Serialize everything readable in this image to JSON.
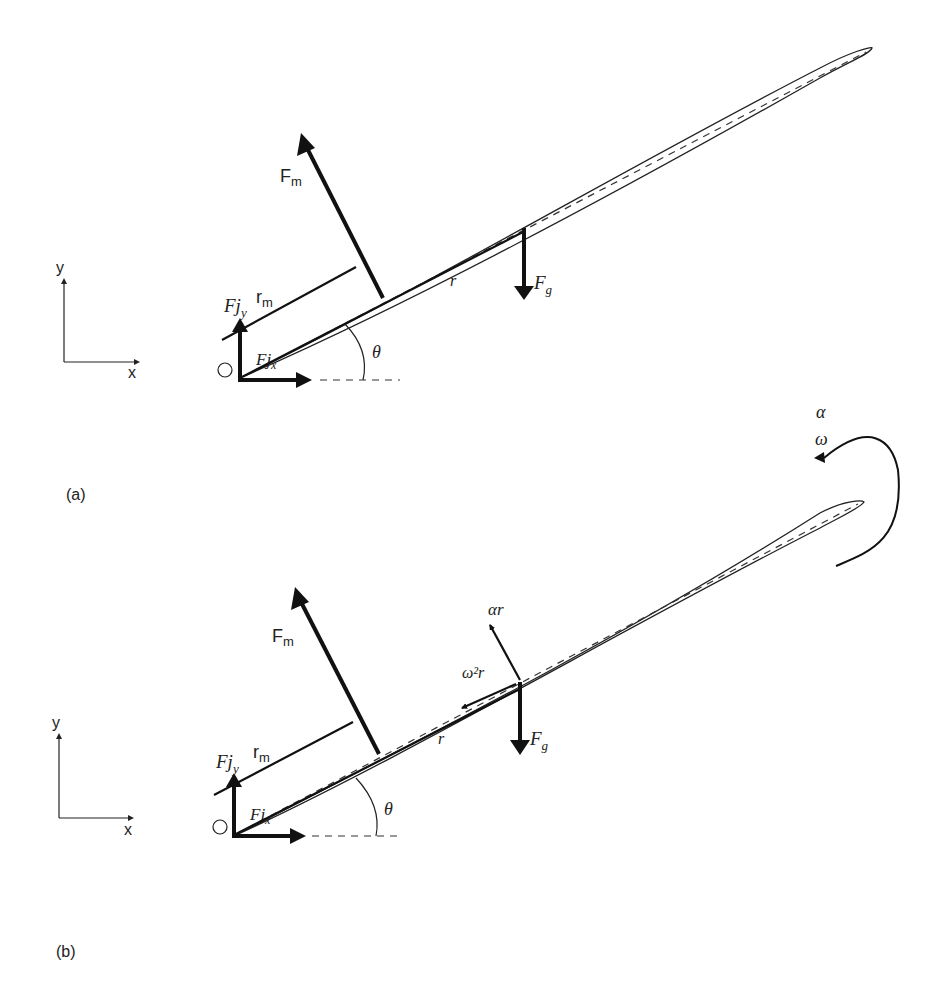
{
  "panels": [
    {
      "id": "a",
      "caption": "(a)",
      "axes": {
        "y": "y",
        "x": "x"
      },
      "origin": "O",
      "labels": {
        "Fm": "F",
        "Fm_sub": "m",
        "Fjy": "Fj",
        "Fjy_sub": "y",
        "Fjx": "Fj",
        "Fjx_sub": "x",
        "rm": "r",
        "rm_sub": "m",
        "r": "r",
        "Fg": "F",
        "Fg_sub": "g",
        "theta": "θ"
      }
    },
    {
      "id": "b",
      "caption": "(b)",
      "axes": {
        "y": "y",
        "x": "x"
      },
      "origin": "O",
      "labels": {
        "Fm": "F",
        "Fm_sub": "m",
        "Fjy": "Fj",
        "Fjy_sub": "y",
        "Fjx": "Fj",
        "Fjx_sub": "x",
        "rm": "r",
        "rm_sub": "m",
        "r": "r",
        "Fg": "F",
        "Fg_sub": "g",
        "theta": "θ",
        "alpha_r": "αr",
        "omega2r": "ω²r",
        "alpha": "α",
        "omega": "ω"
      }
    }
  ]
}
